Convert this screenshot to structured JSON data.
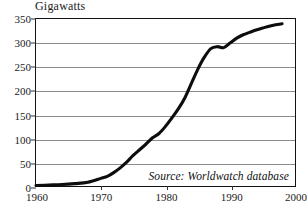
{
  "chart_data": {
    "type": "line",
    "title": "Gigawatts",
    "xlabel": "",
    "ylabel": "Gigawatts",
    "xlim": [
      1960,
      2000
    ],
    "ylim": [
      0,
      350
    ],
    "grid": true,
    "legend": null,
    "annotation": "Source: Worldwatch database",
    "xticks": [
      "1960",
      "1970",
      "1980",
      "1990",
      "2000"
    ],
    "yticks": [
      "0",
      "50",
      "100",
      "150",
      "200",
      "250",
      "300",
      "350"
    ],
    "series": [
      {
        "name": "Installed nuclear capacity",
        "x": [
          1960,
          1962,
          1964,
          1966,
          1968,
          1970,
          1971,
          1972,
          1973,
          1974,
          1975,
          1976,
          1977,
          1978,
          1979,
          1980,
          1981,
          1982,
          1983,
          1984,
          1985,
          1986,
          1987,
          1988,
          1989,
          1990,
          1991,
          1992,
          1993,
          1994,
          1995,
          1996,
          1997,
          1998
        ],
        "values": [
          1,
          2,
          3,
          5,
          8,
          16,
          20,
          28,
          38,
          50,
          64,
          76,
          88,
          101,
          110,
          125,
          143,
          162,
          185,
          215,
          245,
          270,
          288,
          292,
          290,
          300,
          310,
          317,
          322,
          327,
          331,
          335,
          338,
          340
        ]
      }
    ]
  }
}
